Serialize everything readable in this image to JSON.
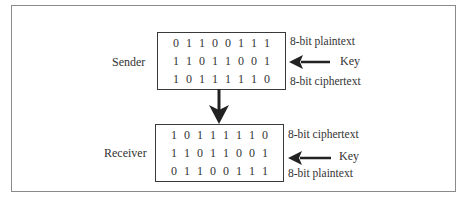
{
  "diagram": {
    "sender": {
      "label": "Sender",
      "rows": [
        {
          "bits": [
            "0",
            "1",
            "1",
            "0",
            "0",
            "1",
            "1",
            "1"
          ],
          "label": "8-bit plaintext"
        },
        {
          "bits": [
            "1",
            "1",
            "0",
            "1",
            "1",
            "0",
            "0",
            "1"
          ],
          "label": "Key",
          "arrow_in": true
        },
        {
          "bits": [
            "1",
            "0",
            "1",
            "1",
            "1",
            "1",
            "1",
            "0"
          ],
          "label": "8-bit ciphertext"
        }
      ]
    },
    "receiver": {
      "label": "Receiver",
      "rows": [
        {
          "bits": [
            "1",
            "0",
            "1",
            "1",
            "1",
            "1",
            "1",
            "0"
          ],
          "label": "8-bit ciphertext"
        },
        {
          "bits": [
            "1",
            "1",
            "0",
            "1",
            "1",
            "0",
            "0",
            "1"
          ],
          "label": "Key",
          "arrow_in": true
        },
        {
          "bits": [
            "0",
            "1",
            "1",
            "0",
            "0",
            "1",
            "1",
            "1"
          ],
          "label": "8-bit plaintext"
        }
      ]
    },
    "colors": {
      "stroke": "#222222",
      "text": "#333333",
      "frame": "#8a8a8a"
    }
  }
}
